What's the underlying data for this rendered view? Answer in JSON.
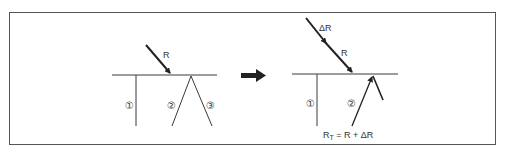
{
  "figure": {
    "colors": {
      "line": "#3a3a3a",
      "arrow": "#222222",
      "frame": "#555555",
      "background": "#ffffff"
    },
    "left_panel": {
      "incident_label": "R",
      "path_labels": [
        "①",
        "②",
        "③"
      ]
    },
    "transition_arrow": "right-arrow",
    "right_panel": {
      "incident_label_top": "ΔR",
      "incident_label": "R",
      "path_labels": [
        "①",
        "②"
      ],
      "formula": {
        "lhs_main": "R",
        "lhs_sub": "T",
        "rhs": " = R + ΔR"
      }
    }
  }
}
